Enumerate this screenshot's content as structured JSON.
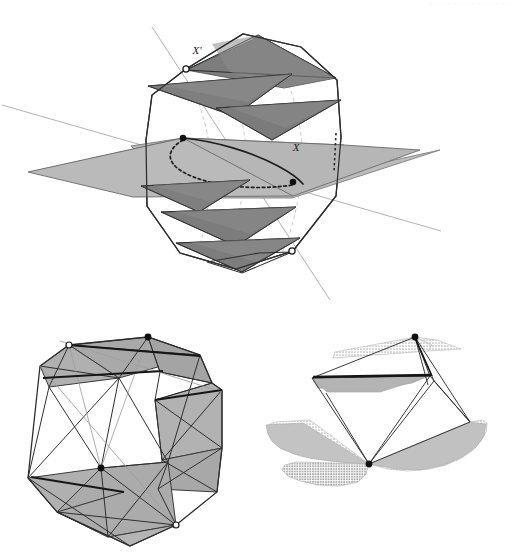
{
  "page": {
    "width": 525,
    "height": 560,
    "background": "#ffffff",
    "running_head": "· · · · · · · · · · · · · ·"
  },
  "palette": {
    "paper": "#ffffff",
    "ink": "#1a1a1a",
    "stroke_dark": "#2b2b2b",
    "stroke_mid": "#595959",
    "stroke_light": "#9a9a9a",
    "stroke_hair": "#b5b5b5",
    "fill_dark_gray": "#7e7e7e",
    "fill_mid_gray": "#9d9d9d",
    "fill_light_gray": "#b9b9b9",
    "fill_pale_gray": "#c9c9c9",
    "vertex_filled": "#111111",
    "vertex_open_fill": "#ffffff",
    "vertex_open_stroke": "#1a1a1a"
  },
  "figures": [
    {
      "id": "figure-top",
      "name": "helical-stack-with-equatorial-plane",
      "caption": "",
      "labels": [
        {
          "text": "X'",
          "x": 197,
          "y": 52,
          "anchor": "middle",
          "style": "italic"
        },
        {
          "text": "X",
          "x": 296,
          "y": 148,
          "anchor": "middle",
          "style": "italic"
        }
      ],
      "vertices": [
        {
          "name": "vertex-x-prime",
          "kind": "open",
          "x": 186,
          "y": 69
        },
        {
          "name": "vertex-x-upper",
          "kind": "filled",
          "x": 183,
          "y": 138
        },
        {
          "name": "vertex-x-lower",
          "kind": "filled",
          "x": 293,
          "y": 182
        },
        {
          "name": "vertex-lower-open",
          "kind": "open",
          "x": 292,
          "y": 251
        }
      ]
    },
    {
      "id": "figure-bottom-left",
      "name": "shaded-polyhedron-wireframe",
      "caption": "",
      "labels": [],
      "vertices": [
        {
          "name": "vertex-top-left-open",
          "kind": "open",
          "x": 69,
          "y": 345
        },
        {
          "name": "vertex-top-right-filled",
          "kind": "filled",
          "x": 148,
          "y": 337
        },
        {
          "name": "vertex-mid-filled",
          "kind": "filled",
          "x": 101,
          "y": 468
        },
        {
          "name": "vertex-bottom-right-open",
          "kind": "open",
          "x": 176,
          "y": 525
        }
      ]
    },
    {
      "id": "figure-bottom-right",
      "name": "stippled-triangular-fans",
      "caption": "",
      "labels": [],
      "vertices": [
        {
          "name": "vertex-apex-filled",
          "kind": "filled",
          "x": 415,
          "y": 337
        },
        {
          "name": "vertex-base-filled",
          "kind": "filled",
          "x": 369,
          "y": 464
        }
      ]
    }
  ],
  "geometry": {
    "top": {
      "outline_octagon": "186,69 243,34 301,47 337,80 341,137 336,196 293,251 236,269 180,253 147,206 146,140 152,95",
      "long_line_a": {
        "x1": 152,
        "y1": 27,
        "x2": 330,
        "y2": 300
      },
      "long_line_b": {
        "x1": 2,
        "y1": 105,
        "x2": 441,
        "y2": 231
      },
      "slabs": [
        {
          "name": "slab-1",
          "tone": "dark",
          "points": "186,69 255,41 332,76 278,88"
        },
        {
          "name": "slab-1b",
          "tone": "dark",
          "points": "255,41 332,76 281,90"
        },
        {
          "name": "slab-2",
          "tone": "dark",
          "points": "150,84 289,76 230,112 186,98"
        },
        {
          "name": "slab-3",
          "tone": "dark",
          "points": "218,105 331,102 268,134"
        },
        {
          "name": "slab-4",
          "tone": "light",
          "points": "131,143 183,138 293,182 341,147 293,196 183,196"
        },
        {
          "name": "slab-5",
          "tone": "dark",
          "points": "143,183 247,178 196,208"
        },
        {
          "name": "slab-6",
          "tone": "dark",
          "points": "163,209 289,205 234,241"
        },
        {
          "name": "slab-7",
          "tone": "dark",
          "points": "178,240 298,236 241,267"
        }
      ],
      "equator_curve_solid": "183,138 232,146 271,160 296,174 302,182",
      "equator_curve_dotted": "183,142 170,152 171,163 190,174 227,184 268,187 293,183"
    }
  },
  "accessibility": {
    "alt": "Plate of three line-drawn geometric figures: a top figure of stacked shaded triangular slabs inside an octagonal outline crossed by two straight lines with labelled points X and X'; a lower-left shaded polyhedron wireframe; a lower-right arrangement of stippled triangular fans."
  }
}
